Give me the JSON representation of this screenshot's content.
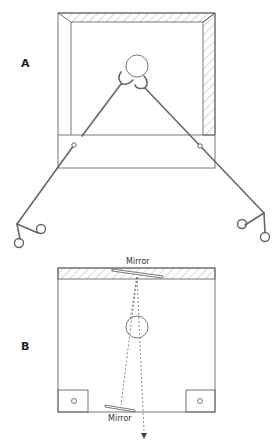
{
  "panels": {
    "a": {
      "label": "A"
    },
    "b": {
      "label": "B",
      "mirror_top_label": "Mirror",
      "mirror_bottom_label": "Mirror"
    }
  },
  "colors": {
    "line": "#444444",
    "hatch": "#9a9a9a",
    "instrument": "#666666"
  }
}
